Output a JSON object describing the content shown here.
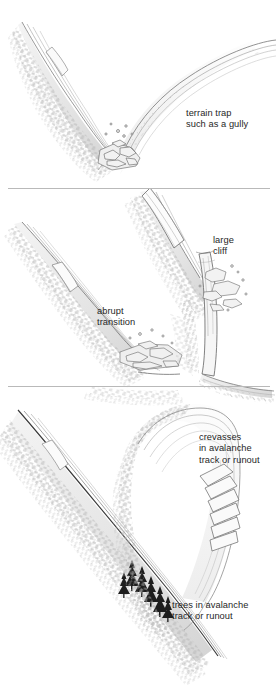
{
  "figure": {
    "background_color": "#ffffff",
    "ink_color": "#555555",
    "terrain_shade_color": "#c9c9c9",
    "tree_color": "#1d1d1d",
    "label_color": "#272727",
    "divider_color": "#b9b9b9"
  },
  "panels": [
    {
      "id": "panel-gully",
      "name": "terrain-trap-gully",
      "label": "terrain trap\nsuch as a gully",
      "label_x": 186,
      "label_y": 108,
      "features": [
        "v-shaped gully",
        "snow-loaded side walls",
        "cornice on left ridge",
        "rock debris in gully floor"
      ]
    },
    {
      "id": "panel-transition",
      "name": "abrupt-transition-and-cliff",
      "labels": [
        {
          "name": "abrupt-transition-label",
          "text": "abrupt\ntransition",
          "label_x": 97,
          "label_y": 306
        },
        {
          "name": "large-cliff-label",
          "text": "large\ncliff",
          "label_x": 213,
          "label_y": 235
        }
      ],
      "features": [
        "convex slope with sharp break",
        "slab on ridge",
        "vertical rock cliff band",
        "rockfall debris"
      ]
    },
    {
      "id": "panel-crevasses-trees",
      "name": "crevasses-and-trees",
      "labels": [
        {
          "name": "crevasses-label",
          "text": "crevasses\nin avalanche\ntrack or runout",
          "label_x": 199,
          "label_y": 432
        },
        {
          "name": "trees-label",
          "text": "trees in avalanche\ntrack or runout",
          "label_x": 172,
          "label_y": 600
        }
      ],
      "features": [
        "glacier with transverse crevasses",
        "long planar slope",
        "stand of conifers in track"
      ]
    }
  ],
  "dividers": [
    {
      "name": "divider-upper",
      "y": 188
    },
    {
      "name": "divider-lower",
      "y": 386
    }
  ]
}
